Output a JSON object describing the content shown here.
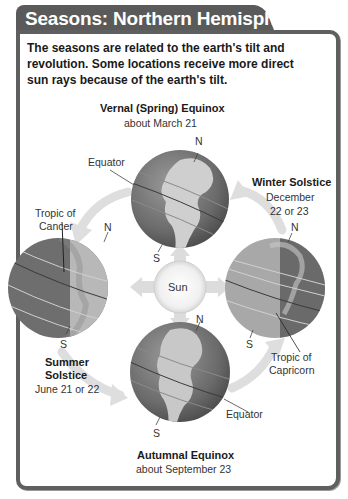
{
  "header": {
    "title": "Seasons: Northern Hemisphere"
  },
  "intro": {
    "text": "The seasons are related to the earth's tilt and revolution. Some locations receive more direct sun rays because of the earth's tilt."
  },
  "diagram": {
    "sun_label": "Sun",
    "positions": {
      "vernal": {
        "title": "Vernal (Spring) Equinox",
        "date": "about March 21",
        "north": "N",
        "south": "S",
        "callout": "Equator"
      },
      "winter": {
        "title": "Winter Solstice",
        "date_line1": "December",
        "date_line2": "22 or 23",
        "north": "N",
        "south": "S",
        "callout_line1": "Tropic of",
        "callout_line2": "Capricorn"
      },
      "summer": {
        "title_line1": "Summer",
        "title_line2": "Solstice",
        "date": "June 21 or 22",
        "north": "N",
        "south": "S",
        "callout_line1": "Tropic of",
        "callout_line2": "Cancer"
      },
      "autumnal": {
        "title": "Autumnal Equinox",
        "date": "about September 23",
        "north": "N",
        "south": "S",
        "callout": "Equator"
      }
    }
  },
  "colors": {
    "frame": "#5f5f5f",
    "tab": "#5a5a5a",
    "globe_dark": "#6e6e6e",
    "globe_light": "#b5b5b5",
    "arrow": "#d9d9d9"
  }
}
